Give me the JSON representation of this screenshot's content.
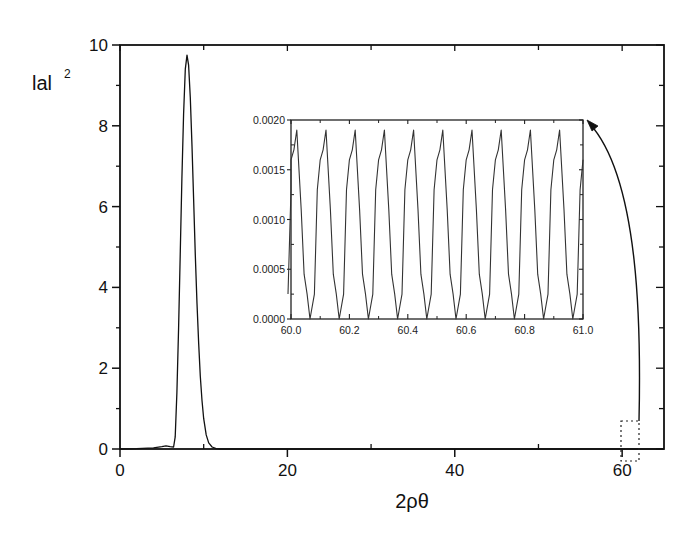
{
  "chart_data": [
    {
      "type": "line",
      "title": "",
      "xlabel": "2ρθ",
      "ylabel": "|a|²",
      "ylabel_text": "lal",
      "ylabel_sup": "2",
      "xlim": [
        0,
        65
      ],
      "ylim": [
        0,
        10
      ],
      "x_ticks": [
        0,
        20,
        40,
        60
      ],
      "x_tick_labels": [
        "0",
        "20",
        "40",
        "60"
      ],
      "x_minor_ticks": [
        10,
        30,
        50
      ],
      "y_ticks": [
        0,
        2,
        4,
        6,
        8,
        10
      ],
      "y_tick_labels": [
        "0",
        "2",
        "4",
        "6",
        "8",
        "10"
      ],
      "y_minor_ticks": [
        1,
        3,
        5,
        7,
        9
      ],
      "grid": false,
      "legend": null,
      "series": [
        {
          "name": "|a|^2",
          "x": [
            0,
            2,
            4,
            5,
            5.5,
            6,
            6.4,
            6.6,
            6.8,
            7.0,
            7.2,
            7.4,
            7.6,
            7.8,
            8.0,
            8.2,
            8.4,
            8.6,
            8.8,
            9.0,
            9.2,
            9.4,
            9.6,
            9.8,
            10.0,
            10.3,
            10.6,
            11.0,
            11.5,
            12,
            20,
            40,
            60,
            65
          ],
          "y": [
            0,
            0.01,
            0.03,
            0.06,
            0.08,
            0.06,
            0.05,
            0.3,
            1.4,
            3.0,
            4.9,
            6.7,
            8.3,
            9.4,
            9.75,
            9.5,
            8.7,
            7.5,
            6.2,
            4.8,
            3.6,
            2.6,
            1.8,
            1.2,
            0.75,
            0.35,
            0.15,
            0.05,
            0.01,
            0,
            0,
            0,
            0,
            0
          ]
        }
      ],
      "annotations": [
        {
          "type": "dashed-box",
          "x_range": [
            60,
            62.2
          ],
          "y_range": [
            -0.3,
            0.7
          ],
          "label": "zoom region"
        },
        {
          "type": "arrow",
          "from": "dashed-box",
          "to": "inset-top-right"
        }
      ]
    },
    {
      "type": "line",
      "role": "inset",
      "title": "",
      "xlabel": "",
      "ylabel": "",
      "xlim": [
        60.0,
        61.0
      ],
      "ylim": [
        0.0,
        0.002
      ],
      "x_ticks": [
        60.0,
        60.2,
        60.4,
        60.6,
        60.8,
        61.0
      ],
      "x_tick_labels": [
        "60.0",
        "60.2",
        "60.4",
        "60.6",
        "60.8",
        "61.0"
      ],
      "y_ticks": [
        0.0,
        0.0005,
        0.001,
        0.0015,
        0.002
      ],
      "y_tick_labels": [
        "0.0000",
        "0.0005",
        "0.0010",
        "0.0015",
        "0.0020"
      ],
      "grid": false,
      "period": 0.1,
      "series": [
        {
          "name": "|a|^2 (zoom)",
          "x_offsets_per_period": [
            0.0,
            0.01,
            0.02,
            0.035,
            0.045,
            0.055,
            0.065,
            0.08,
            0.09
          ],
          "y_per_period": [
            0.0016,
            0.0017,
            0.0019,
            0.0011,
            0.00045,
            0.00025,
            0.0,
            0.00025,
            0.0013
          ],
          "x_start": 60.0,
          "periods": 10,
          "peak_value": 0.0019,
          "min_value": 0.0
        }
      ]
    }
  ]
}
